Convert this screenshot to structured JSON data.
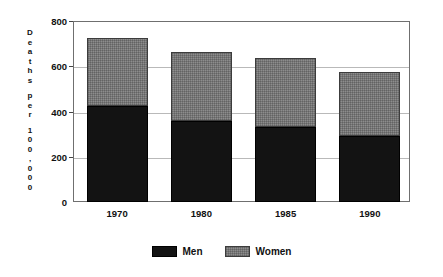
{
  "chart_data": {
    "type": "bar",
    "subtype": "stacked-vertical",
    "title": "",
    "xlabel": "",
    "ylabel": "Deaths per 100,000",
    "ylabel_chars": [
      "D",
      "e",
      "a",
      "t",
      "h",
      "s",
      "",
      "p",
      "e",
      "r",
      "",
      "1",
      "0",
      "0",
      ",",
      "0",
      "0",
      "0"
    ],
    "categories": [
      "1970",
      "1980",
      "1985",
      "1990"
    ],
    "series": [
      {
        "name": "Men",
        "color": "#131313",
        "values": [
          425,
          360,
          330,
          290
        ]
      },
      {
        "name": "Women",
        "color": "#8d8d8d",
        "values": [
          300,
          305,
          305,
          285
        ]
      }
    ],
    "totals": [
      725,
      665,
      635,
      575
    ],
    "ylim": [
      0,
      800
    ],
    "yticks": [
      0,
      200,
      400,
      600,
      800
    ],
    "ytick_labels": [
      "0",
      "200",
      "400",
      "600",
      "800"
    ],
    "grid": true,
    "grid_axis": "y",
    "legend": {
      "position": "bottom-center",
      "entries": [
        {
          "label": "Men",
          "swatch": "solid-black"
        },
        {
          "label": "Women",
          "swatch": "hatched-gray"
        }
      ]
    }
  }
}
